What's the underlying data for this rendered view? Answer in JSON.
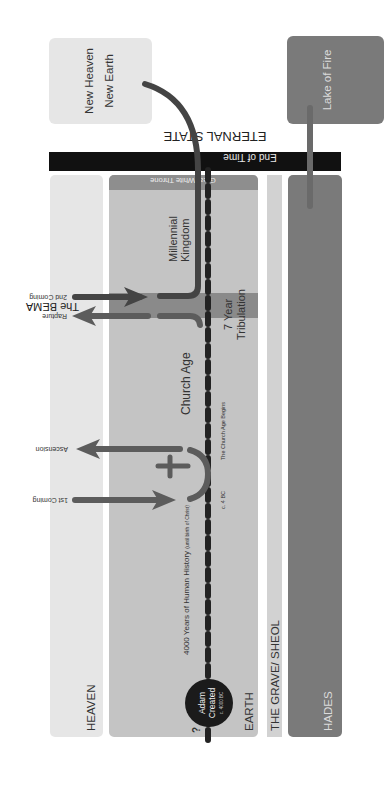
{
  "diagram": {
    "orientation": "rotated 90deg clockwise",
    "eternal_state": {
      "title": "ETERNAL STATE",
      "new_heaven_line1": "New Heaven",
      "new_heaven_line2": "New Earth",
      "lake_of_fire": "Lake of Fire"
    },
    "end_of_time": "End of Time",
    "realms": {
      "heaven": "HEAVEN",
      "earth": "EARTH",
      "grave": "THE GRAVE/ SHEOL",
      "hades": "HADES"
    },
    "great_white_throne": "Great White Throne",
    "timeline": {
      "question_mark": "?",
      "adam_line1": "Adam",
      "adam_line2": "Created",
      "adam_date": "c. 4000 BC",
      "human_history": "4000 Years of Human History",
      "human_history_note": "(until birth of Christ)",
      "birth_date": "c. 4 BC",
      "church_age_begins": "The Church Age Begins",
      "church_age": "Church Age",
      "tribulation_line1": "7 Year",
      "tribulation_line2": "Tribulation",
      "millennial_line1": "Millennial",
      "millennial_line2": "Kingdom"
    },
    "events": {
      "first_coming": "1st Coming",
      "ascension": "Ascension",
      "rapture": "Rapture",
      "bema": "The BEMA",
      "second_coming": "2nd Coming"
    },
    "colors": {
      "heaven": "#e6e6e6",
      "earth": "#c4c4c4",
      "grave": "#d2d2d2",
      "hades": "#7a7a7a",
      "lake_of_fire": "#7a7a7a",
      "new_heaven": "#e6e6e6",
      "end_of_time": "#111111",
      "great_white_throne": "#8e8e8e",
      "tribulation": "#8a8a8a",
      "arrow": "#5c5c5c",
      "path": "#444444",
      "dash": "#222222"
    }
  }
}
